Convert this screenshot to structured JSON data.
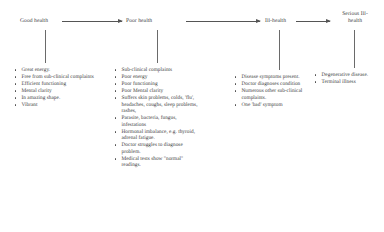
{
  "diagram": {
    "type": "flow",
    "line_color": "#555555",
    "text_color": "#3d3d3d",
    "bullet_glyph": "•",
    "stages": [
      {
        "id": "good-health",
        "label": "Good health",
        "items": [
          "Great energy.",
          "Free from sub-clinical complaints",
          "Efficient functioning",
          "Mental clarity",
          "In amazing shape.",
          "Vibrant"
        ]
      },
      {
        "id": "poor-health",
        "label": "Poor health",
        "items": [
          "Sub-clinical complaints",
          "Poor energy",
          "Poor functioning",
          "Poor Mental clarity",
          "Suffers skin problems, colds, 'flu', headaches, coughs, sleep problems, rashes,",
          "Parasite, bacteria, fungus, infestations",
          "Hormonal imbalance, e.g. thyroid, adrenal fatigue.",
          "Doctor struggles to diagnose problem.",
          "Medical tests show \"normal\" readings."
        ]
      },
      {
        "id": "ill-health",
        "label": "Ill-health",
        "items": [
          "Disease symptoms present.",
          "Doctor diagnoses condition",
          "Numerous other sub-clinical complaints.",
          "One 'bad' symptom"
        ]
      },
      {
        "id": "serious-ill-health",
        "label": "Serious Ill-health",
        "items": [
          "Degenerative disease.",
          "Terminal illness"
        ]
      }
    ]
  }
}
